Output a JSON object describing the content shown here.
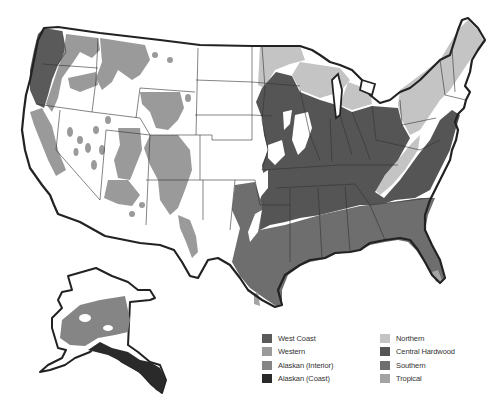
{
  "map": {
    "subject": "Forest regions of the United States",
    "regions_shown": [
      "Contiguous United States",
      "Alaska"
    ]
  },
  "legend": {
    "left_column": [
      {
        "label": "West Coast",
        "color": "#5a5a5a",
        "icon": "west-coast-swatch"
      },
      {
        "label": "Western",
        "color": "#9a9a9a",
        "icon": "western-swatch"
      },
      {
        "label": "Alaskan (Interior)",
        "color": "#858585",
        "icon": "alaskan-interior-swatch"
      },
      {
        "label": "Alaskan (Coast)",
        "color": "#2a2a2a",
        "icon": "alaskan-coast-swatch"
      }
    ],
    "right_column": [
      {
        "label": "Northern",
        "color": "#c4c4c4",
        "icon": "northern-swatch"
      },
      {
        "label": "Central Hardwood",
        "color": "#555555",
        "icon": "central-hardwood-swatch"
      },
      {
        "label": "Southern",
        "color": "#6e6e6e",
        "icon": "southern-swatch"
      },
      {
        "label": "Tropical",
        "color": "#a3a3a3",
        "icon": "tropical-swatch"
      }
    ]
  }
}
